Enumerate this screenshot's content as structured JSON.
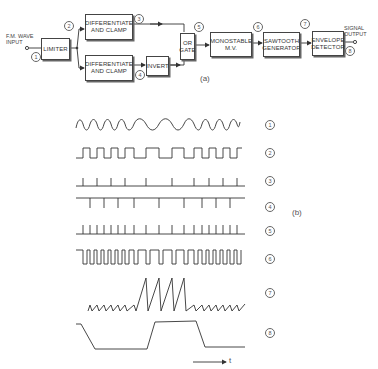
{
  "figure_a": {
    "caption": "(a)",
    "input_label": "F.M. WAVE INPUT",
    "output_label": "SIGNAL OUTPUT",
    "blocks": {
      "limiter": "LIMITER",
      "diff_clamp_top": "DIFFERENTIATE AND CLAMP",
      "diff_clamp_bottom": "DIFFERENTIATE AND CLAMP",
      "invert": "INVERT",
      "or_gate": "OR GATE",
      "monostable": "MONOSTABLE M.V.",
      "sawtooth": "SAWTOOTH GENERATOR",
      "envelope": "ENVELOPE DETECTOR"
    },
    "nodes": [
      "1",
      "2",
      "3",
      "4",
      "5",
      "6",
      "7",
      "8"
    ]
  },
  "figure_b": {
    "caption": "(b)",
    "time_axis_label": "t",
    "waveforms": [
      {
        "id": "1",
        "label": "1",
        "type": "fm-sine"
      },
      {
        "id": "2",
        "label": "2",
        "type": "limited-square"
      },
      {
        "id": "3",
        "label": "3",
        "type": "positive-pulses"
      },
      {
        "id": "4",
        "label": "4",
        "type": "negative-pulses"
      },
      {
        "id": "5",
        "label": "5",
        "type": "combined-pulses"
      },
      {
        "id": "6",
        "label": "6",
        "type": "monostable-output"
      },
      {
        "id": "7",
        "label": "7",
        "type": "sawtooth"
      },
      {
        "id": "8",
        "label": "8",
        "type": "envelope-output"
      }
    ]
  }
}
